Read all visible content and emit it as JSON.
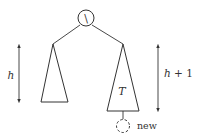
{
  "diagram": {
    "type": "avl-tree-insertion",
    "root": {
      "balance_glyph": "\\"
    },
    "left_subtree": {
      "height_label": "h"
    },
    "right_subtree": {
      "name": "T",
      "height_label_var": "h",
      "height_label_suffix": " + 1"
    },
    "new_node": {
      "label": "new",
      "style": "dashed"
    },
    "colors": {
      "stroke": "#333333",
      "background": "#ffffff"
    }
  }
}
